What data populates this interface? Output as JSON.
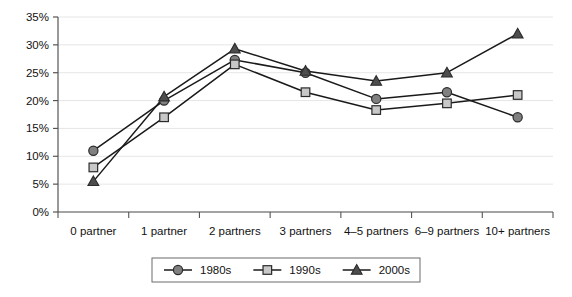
{
  "chart_data": {
    "type": "line",
    "title": "",
    "subtitle": "",
    "xlabel": "",
    "ylabel": "",
    "categories": [
      "0 partner",
      "1 partner",
      "2 partners",
      "3 partners",
      "4–5 partners",
      "6–9 partners",
      "10+ partners"
    ],
    "series": [
      {
        "name": "1980s",
        "marker": "circle",
        "color": "#808080",
        "line_color": "#1a1a1a",
        "values": [
          11.0,
          20.0,
          27.3,
          25.0,
          20.3,
          21.5,
          17.0
        ]
      },
      {
        "name": "1990s",
        "marker": "square",
        "color": "#c8c8c8",
        "line_color": "#1a1a1a",
        "values": [
          8.0,
          17.0,
          26.5,
          21.5,
          18.3,
          19.5,
          21.0
        ]
      },
      {
        "name": "2000s",
        "marker": "triangle",
        "color": "#4d4d4d",
        "line_color": "#1a1a1a",
        "values": [
          5.5,
          20.7,
          29.3,
          25.3,
          23.5,
          25.0,
          32.0
        ]
      }
    ],
    "ylim": [
      0,
      35
    ],
    "ytick_values": [
      0,
      5,
      10,
      15,
      20,
      25,
      30,
      35
    ],
    "ytick_labels": [
      "0%",
      "5%",
      "10%",
      "15%",
      "20%",
      "25%",
      "30%",
      "35%"
    ],
    "grid": true,
    "grid_color": "#e6e6e6",
    "axis_color": "#555555",
    "legend_position": "bottom",
    "legend_entries": [
      "1980s",
      "1990s",
      "2000s"
    ]
  }
}
